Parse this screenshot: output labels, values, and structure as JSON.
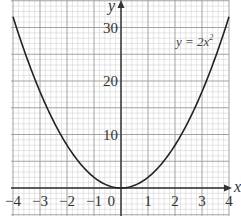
{
  "chart_data": {
    "type": "line",
    "title": "",
    "xlabel": "x",
    "ylabel": "y",
    "xlim": [
      -4,
      4
    ],
    "ylim": [
      -5,
      35
    ],
    "grid": true,
    "x_ticks": [
      "-4",
      "-3",
      "-2",
      "-1",
      "0",
      "1",
      "2",
      "3",
      "4"
    ],
    "y_ticks": [
      "10",
      "20",
      "30"
    ],
    "series": [
      {
        "name": "y = 2x²",
        "function": "y = 2x^2",
        "x": [
          -4,
          -3.5,
          -3,
          -2.5,
          -2,
          -1.5,
          -1,
          -0.5,
          0,
          0.5,
          1,
          1.5,
          2,
          2.5,
          3,
          3.5,
          4
        ],
        "y": [
          32,
          24.5,
          18,
          12.5,
          8,
          4.5,
          2,
          0.5,
          0,
          0.5,
          2,
          4.5,
          8,
          12.5,
          18,
          24.5,
          32
        ]
      }
    ],
    "annotations": [
      {
        "text": "y = 2x²",
        "x": 2.5,
        "y": 28
      }
    ],
    "colors": {
      "curve": "#222222",
      "axis": "#333333",
      "major_grid": "#999999",
      "minor_grid": "#d4d4d4"
    }
  },
  "labels": {
    "x_axis": "x",
    "y_axis": "y",
    "curve": "y = 2x",
    "curve_exp": "2",
    "x_ticks": [
      "−4",
      "−3",
      "−2",
      "−1",
      "0",
      "1",
      "2",
      "3",
      "4"
    ],
    "y_ticks": [
      "10",
      "20",
      "30"
    ]
  }
}
